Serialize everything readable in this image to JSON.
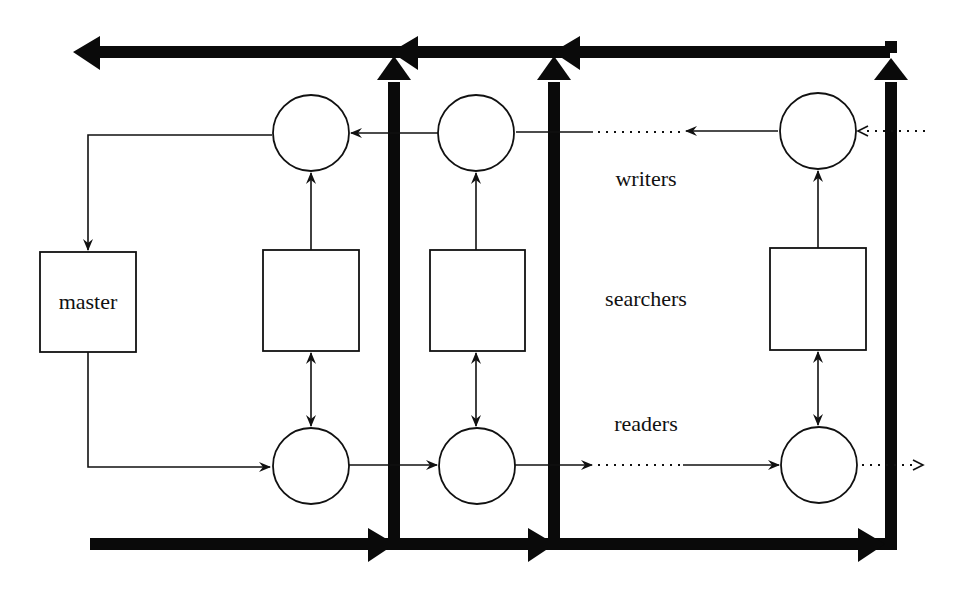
{
  "diagram": {
    "labels": {
      "master": "master",
      "writers": "writers",
      "searchers": "searchers",
      "readers": "readers"
    },
    "colors": {
      "ink": "#111111",
      "background": "#ffffff"
    }
  }
}
